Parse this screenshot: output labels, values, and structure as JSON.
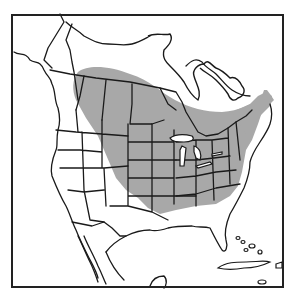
{
  "map": {
    "type": "species-range-map",
    "region": "North America",
    "style": "black-and-white line drawing",
    "colors": {
      "background": "#ffffff",
      "border": "#1a1a1a",
      "range_fill": "#a8a8a8",
      "frame": "#222222"
    },
    "range": {
      "description": "Shaded distribution from the Canadian prairie provinces eastward across southern Canada to the Maritimes, and across the central and northeastern United States",
      "areas": [
        "Canadian Prairies",
        "Southern Ontario and Quebec",
        "Maritimes and Newfoundland",
        "Great Plains",
        "Midwest",
        "Great Lakes",
        "Northeastern US",
        "Mid-Atlantic"
      ]
    }
  }
}
